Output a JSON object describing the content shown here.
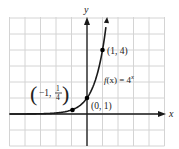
{
  "chart_data": {
    "type": "line",
    "title": "",
    "function_label": "f(x) = 4^x",
    "function_label_parts": {
      "prefix": "f",
      "arg": "(x) = 4",
      "exp": "x"
    },
    "xlabel": "x",
    "ylabel": "y",
    "xlim": [
      -5,
      5
    ],
    "ylim": [
      -2,
      6
    ],
    "grid": true,
    "grid_step": 1,
    "series": [
      {
        "name": "f(x) = 4^x",
        "x": [
          -5,
          -4,
          -3,
          -2,
          -1,
          -0.5,
          0,
          0.5,
          1,
          1.3
        ],
        "values": [
          0.00098,
          0.0039,
          0.0156,
          0.0625,
          0.25,
          0.5,
          1,
          2,
          4,
          6.06
        ]
      }
    ],
    "labeled_points": [
      {
        "x": -1,
        "y": 0.25,
        "label_left": "−1,",
        "label_num": "1",
        "label_den": "4"
      },
      {
        "x": 0,
        "y": 1,
        "label": "(0, 1)"
      },
      {
        "x": 1,
        "y": 4,
        "label": "(1, 4)"
      }
    ],
    "colors": {
      "curve": "#1a1a1a",
      "grid": "#d4d4d4",
      "axis": "#1a1a1a",
      "background": "#ffffff"
    }
  }
}
